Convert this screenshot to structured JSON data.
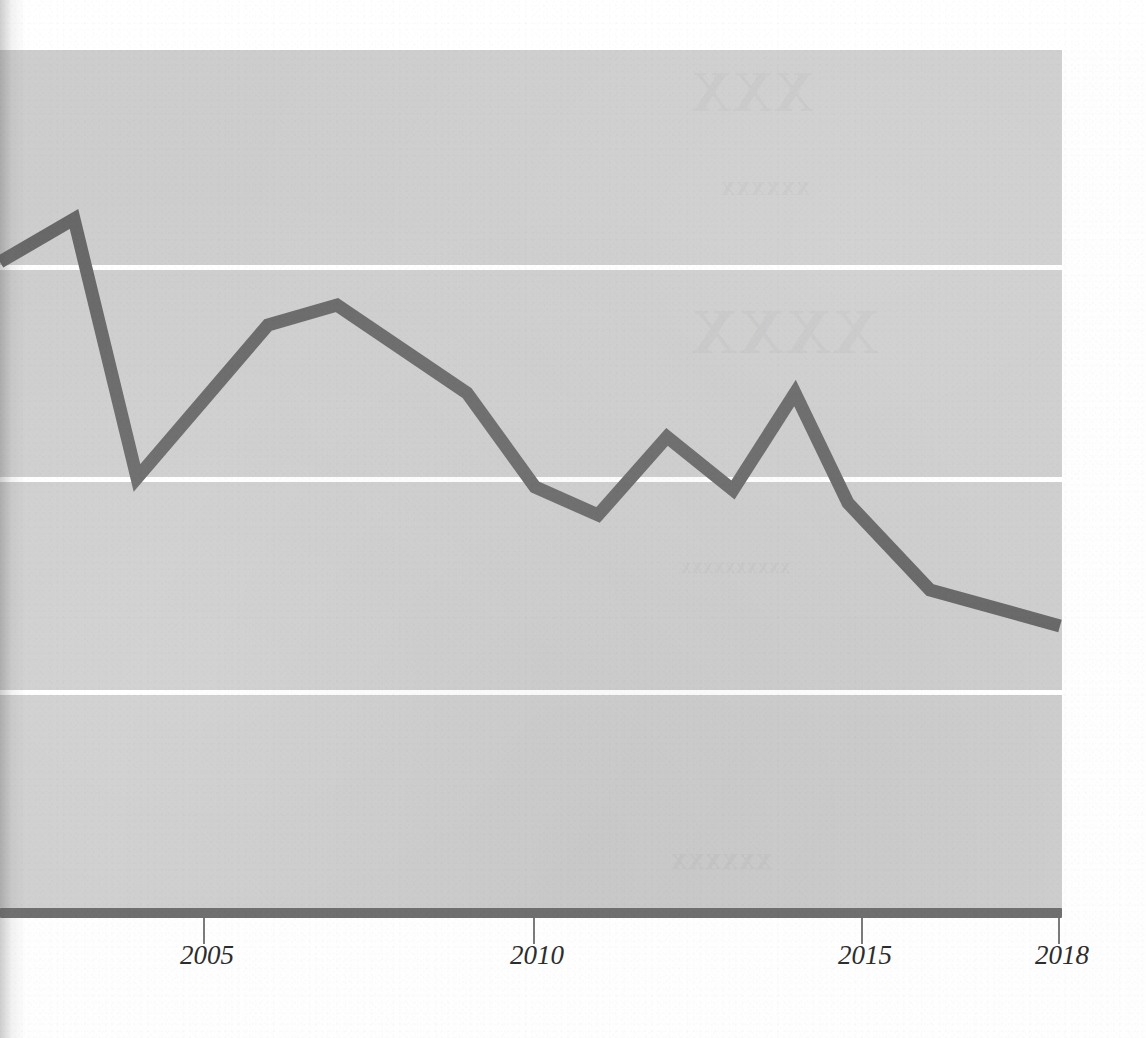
{
  "chart_data": {
    "type": "line",
    "title": "",
    "subtitle": "",
    "xlabel": "",
    "ylabel": "",
    "xlim": [
      2001.9,
      2018.0
    ],
    "ylim": [
      0,
      4
    ],
    "grid": true,
    "gridlines_y": [
      3,
      2,
      1
    ],
    "legend": null,
    "x": [
      2002,
      2003,
      2004,
      2006,
      2007,
      2009,
      2010,
      2011,
      2012,
      2013,
      2014,
      2015,
      2016,
      2018
    ],
    "values": [
      3.06,
      3.87,
      2.0,
      3.72,
      3.92,
      3.09,
      2.21,
      1.95,
      2.69,
      2.19,
      3.09,
      1.94,
      1.12,
      0.78
    ],
    "series": [
      {
        "name": "series-1",
        "color": "#666666",
        "points": [
          {
            "x": 2002,
            "y": 3.06,
            "px": 0,
            "py": 262
          },
          {
            "x": 2003,
            "y": 3.87,
            "px": 74,
            "py": 219
          },
          {
            "x": 2004,
            "y": 2.0,
            "px": 137,
            "py": 478
          },
          {
            "x": 2006,
            "y": 3.72,
            "px": 268,
            "py": 325
          },
          {
            "x": 2007,
            "y": 3.92,
            "px": 337,
            "py": 305
          },
          {
            "x": 2009,
            "y": 3.09,
            "px": 467,
            "py": 393
          },
          {
            "x": 2010,
            "y": 2.21,
            "px": 535,
            "py": 487
          },
          {
            "x": 2011,
            "y": 1.95,
            "px": 598,
            "py": 515
          },
          {
            "x": 2012,
            "y": 2.69,
            "px": 667,
            "py": 437
          },
          {
            "x": 2013,
            "y": 2.19,
            "px": 733,
            "py": 490
          },
          {
            "x": 2014,
            "y": 3.09,
            "px": 795,
            "py": 393
          },
          {
            "x": 2015,
            "y": 1.94,
            "px": 848,
            "py": 503
          },
          {
            "x": 2016,
            "y": 1.12,
            "px": 930,
            "py": 590
          },
          {
            "x": 2018,
            "y": 0.78,
            "px": 1060,
            "py": 626
          }
        ]
      }
    ],
    "x_ticks": [
      {
        "label": "2005",
        "px": 203
      },
      {
        "label": "2010",
        "px": 533
      },
      {
        "label": "2015",
        "px": 861
      },
      {
        "label": "2018",
        "px": 1058
      }
    ],
    "gridline_px": [
      265,
      477,
      690
    ],
    "colors": {
      "plot_background": "#cdcdcd",
      "gridline": "#ffffff",
      "line": "#666666",
      "axis": "#6f6f6f",
      "tick_label": "#2d2d2d",
      "page_background": "#ffffff"
    },
    "plot_rect": {
      "left": 0,
      "top": 50,
      "width": 1062,
      "height": 863
    },
    "line_width": 13
  },
  "page": {
    "ghost_text": [
      {
        "text": "a",
        "px": 700,
        "py": 62,
        "size": 56
      },
      {
        "text": "b",
        "px": 730,
        "py": 175,
        "size": 30
      },
      {
        "text": "c",
        "px": 700,
        "py": 300,
        "size": 62
      },
      {
        "text": "d",
        "px": 690,
        "py": 560,
        "size": 22
      },
      {
        "text": "e",
        "px": 680,
        "py": 840,
        "size": 34
      }
    ]
  }
}
